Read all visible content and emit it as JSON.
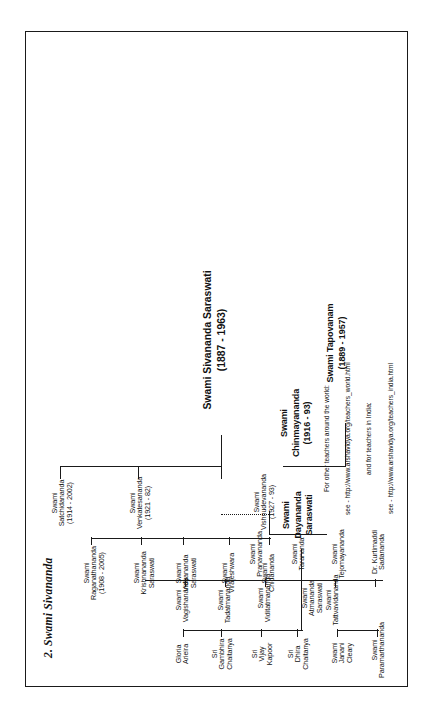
{
  "document": {
    "section_title": "2. Swami Sivananda",
    "chart_type": "lineage-tree",
    "orientation": "rotated-90-ccw"
  },
  "root": {
    "name": "Swami Sivananda Saraswati",
    "dates": "(1887 - 1963)"
  },
  "second_root": {
    "name": "Swami Tapovanam",
    "dates": "(1889 - 1957)"
  },
  "gen2": [
    {
      "name": "Swami\nSatchidananda",
      "dates": "(1914 - 2002)"
    },
    {
      "name": "Swami\nVenkatesananda",
      "dates": "(1921 - 82)"
    },
    {
      "name": "Swami\nVishnudevananda",
      "dates": "(1927 - 93)"
    },
    {
      "name": "Swami\nChinmayananda",
      "dates": "(1916 - 93)"
    }
  ],
  "gen3": [
    {
      "name": "Swami\nRaganathananda",
      "dates": "(1908 - 2005)"
    },
    {
      "name": "Swami\nKrishnananda\nSaraswati",
      "dates": ""
    },
    {
      "name": "Swami\nVidyananda\nSaraswati",
      "dates": ""
    },
    {
      "name": "Swami\nVirajeshwara",
      "dates": ""
    },
    {
      "name": "Swami\nChidananda",
      "dates": ""
    },
    {
      "name": "Swami\nPranavananda",
      "dates": ""
    },
    {
      "name": "Swami\nTarananda",
      "dates": ""
    },
    {
      "name": "Swami\nAtmananda\nSaraswati",
      "dates": ""
    },
    {
      "name": "Swami\nTejomayananda",
      "dates": ""
    },
    {
      "name": "Dr. Kurtimaddi\nSadananda",
      "dates": ""
    }
  ],
  "dayananda": {
    "name": "Swami\nDayananda\nSaraswati",
    "dates": ""
  },
  "disciples": [
    {
      "name": "Gloria\nArieira"
    },
    {
      "name": "Sri\nGambhira\nChaitanya"
    },
    {
      "name": "Sri\nVijay\nKapoor"
    },
    {
      "name": "Sri\nDhira\nChaitanya"
    },
    {
      "name": "Swami\nVagishananda"
    },
    {
      "name": "Swami\nTadatmananda"
    },
    {
      "name": "Swami\nViditatmananda"
    },
    {
      "name": "Swami\nTattvavidananda"
    },
    {
      "name": "Swami\nPratyagbodhananda"
    },
    {
      "name": "Swamini\nMayatitananda"
    },
    {
      "name": "Swami\nParamarthananda"
    },
    {
      "name": "Swami\nJanani\nCleary"
    }
  ],
  "footer": {
    "line1": "For other teachers around the world:",
    "line2": "see - http://www.arshavidya.org/teachers_world.html",
    "line3": "and for teachers in India:",
    "line4": "see - http://www.arshavidya.org/teachers_india.html"
  },
  "colors": {
    "ink": "#1a1a1a",
    "paper": "#ffffff"
  }
}
